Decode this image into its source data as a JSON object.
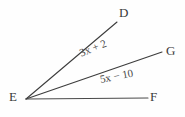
{
  "figure": {
    "type": "angle-diagram",
    "background_color": "#fefefe",
    "stroke_color": "#3c3c3c",
    "text_color": "#3a3a3a",
    "vertex": {
      "name": "E",
      "label": "E",
      "x": 26,
      "y": 99
    },
    "rays": [
      {
        "name": "ray-ED",
        "endpoint_label": "D",
        "from_x": 26,
        "from_y": 99,
        "to_x": 117,
        "to_y": 22
      },
      {
        "name": "ray-EG",
        "endpoint_label": "G",
        "from_x": 26,
        "from_y": 99,
        "to_x": 162,
        "to_y": 52
      },
      {
        "name": "ray-EF",
        "endpoint_label": "F",
        "from_x": 26,
        "from_y": 99,
        "to_x": 148,
        "to_y": 98
      }
    ],
    "point_labels": {
      "D": "D",
      "G": "G",
      "F": "F",
      "E": "E"
    },
    "angle_measures": [
      {
        "name": "angle-DEG",
        "expression": "3x + 2",
        "between": [
          "D",
          "G"
        ],
        "rotation_deg": -22
      },
      {
        "name": "angle-GEF",
        "expression": "5x − 10",
        "between": [
          "G",
          "F"
        ],
        "rotation_deg": -11
      }
    ]
  }
}
